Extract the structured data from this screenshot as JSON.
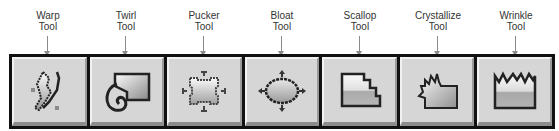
{
  "toolbar": {
    "tools": [
      {
        "name": "warp",
        "label_line1": "Warp",
        "label_line2": "Tool",
        "icon": "warp-icon"
      },
      {
        "name": "twirl",
        "label_line1": "Twirl",
        "label_line2": "Tool",
        "icon": "twirl-icon"
      },
      {
        "name": "pucker",
        "label_line1": "Pucker",
        "label_line2": "Tool",
        "icon": "pucker-icon"
      },
      {
        "name": "bloat",
        "label_line1": "Bloat",
        "label_line2": "Tool",
        "icon": "bloat-icon"
      },
      {
        "name": "scallop",
        "label_line1": "Scallop",
        "label_line2": "Tool",
        "icon": "scallop-icon"
      },
      {
        "name": "crystallize",
        "label_line1": "Crystallize",
        "label_line2": "Tool",
        "icon": "crystallize-icon"
      },
      {
        "name": "wrinkle",
        "label_line1": "Wrinkle",
        "label_line2": "Tool",
        "icon": "wrinkle-icon"
      }
    ]
  },
  "colors": {
    "frame": "#111111",
    "button_face": "#d6d6d6",
    "callout_line": "#8a8a8a"
  }
}
